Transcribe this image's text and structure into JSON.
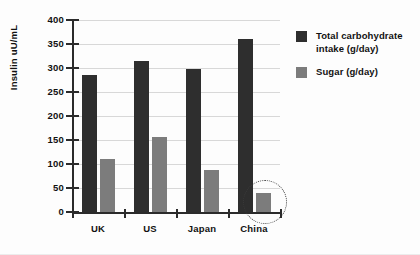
{
  "chart_data": {
    "type": "bar",
    "title": "",
    "subtitle": "",
    "xlabel": "",
    "ylabel": "Insulin uU/mL",
    "categories": [
      "UK",
      "US",
      "Japan",
      "China"
    ],
    "series": [
      {
        "name": "Total carbohydrate intake (g/day)",
        "color": "#2e2e2e",
        "values": [
          285,
          315,
          298,
          360
        ]
      },
      {
        "name": "Sugar (g/day)",
        "color": "#7c7c7c",
        "values": [
          110,
          156,
          88,
          40
        ]
      }
    ],
    "ylim": [
      0,
      400
    ],
    "yticks": [
      0,
      50,
      100,
      150,
      200,
      250,
      300,
      350,
      400
    ],
    "ytick_labels": [
      "0",
      "50",
      "100",
      "150",
      "200",
      "250",
      "300",
      "350",
      "400"
    ],
    "grid": true,
    "grid_axis": "y",
    "legend_position": "right",
    "annotations": [
      {
        "type": "dotted-circle-highlight",
        "target_series": "Sugar (g/day)",
        "target_category": "China",
        "color": "#3a3a3a"
      }
    ]
  },
  "legend": {
    "entries": [
      {
        "label": "Total carbohydrate intake (g/day)",
        "color": "#2e2e2e"
      },
      {
        "label": "Sugar (g/day)",
        "color": "#7c7c7c"
      }
    ]
  },
  "axes": {
    "y_title": "Insulin uU/mL",
    "y_tick_labels": [
      "400",
      "350",
      "300",
      "250",
      "200",
      "150",
      "100",
      "50",
      "0"
    ],
    "x_tick_labels": [
      "UK",
      "US",
      "Japan",
      "China"
    ]
  }
}
